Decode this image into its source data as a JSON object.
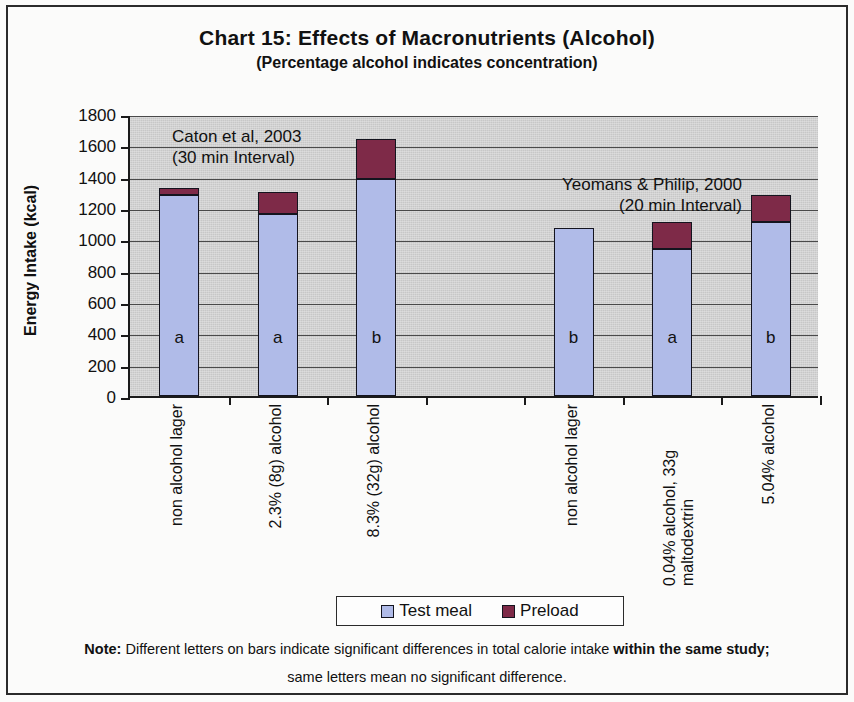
{
  "chart_data": {
    "type": "bar",
    "subtype": "stacked",
    "title": "Chart 15:  Effects of Macronutrients (Alcohol)",
    "subtitle": "(Percentage alcohol indicates concentration)",
    "xlabel": "",
    "ylabel": "Energy Intake (kcal)",
    "ylim": [
      0,
      1800
    ],
    "ytick_step": 200,
    "yticks": [
      "1800",
      "1600",
      "1400",
      "1200",
      "1000",
      "800",
      "600",
      "400",
      "200",
      "0"
    ],
    "grid": true,
    "grid_axis": "y",
    "legend_position": "bottom",
    "categories": [
      "non alcohol lager",
      "2.3% (8g) alcohol",
      "8.3% (32g) alcohol",
      "",
      "non alcohol lager",
      "0.04% alcohol, 33g maltodextrin",
      "5.04% alcohol"
    ],
    "series": [
      {
        "name": "Test meal",
        "color": "#b0bbe8",
        "values": [
          1280,
          1160,
          1385,
          null,
          1070,
          940,
          1110
        ]
      },
      {
        "name": "Preload",
        "color": "#7e2a48",
        "values": [
          50,
          140,
          255,
          null,
          0,
          170,
          170
        ]
      }
    ],
    "totals": [
      1330,
      1300,
      1640,
      null,
      1070,
      1110,
      1280
    ],
    "bar_labels": [
      "a",
      "a",
      "b",
      "",
      "b",
      "a",
      "b"
    ],
    "annotations": [
      {
        "name": "caton-study",
        "line1": "Caton et al, 2003",
        "line2": "(30 min Interval)"
      },
      {
        "name": "yeomans-study",
        "line1": "Yeomans & Philip, 2000",
        "line2": "(20 min Interval)"
      }
    ]
  },
  "legend": {
    "items": [
      {
        "label": "Test meal",
        "color": "#b0bbe8"
      },
      {
        "label": "Preload",
        "color": "#7e2a48"
      }
    ]
  },
  "footnote": {
    "prefix": "Note:",
    "line1_a": " Different letters on bars indicate significant differences in total calorie intake ",
    "line1_b": "within the same study;",
    "line2": "same letters mean no significant difference."
  }
}
